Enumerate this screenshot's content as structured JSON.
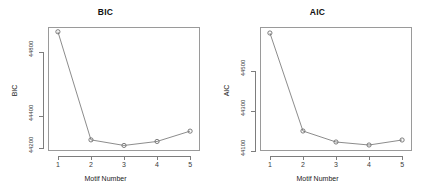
{
  "figure": {
    "background_color": "#ffffff",
    "line_color": "#6e6e6e",
    "axis_color": "#7d7d7d"
  },
  "panels": [
    {
      "key": "bic",
      "title": "BIC",
      "xlabel": "Motif Number",
      "ylabel": "BIC",
      "x_tick_labels": [
        "1",
        "2",
        "3",
        "4",
        "5"
      ],
      "y_tick_labels": [
        "44800",
        "44400",
        "44200"
      ]
    },
    {
      "key": "aic",
      "title": "AIC",
      "xlabel": "Motif Number",
      "ylabel": "AIC",
      "x_tick_labels": [
        "1",
        "2",
        "3",
        "4",
        "5"
      ],
      "y_tick_labels": [
        "44500",
        "44300",
        "44100"
      ]
    }
  ],
  "chart_data": [
    {
      "type": "line",
      "title": "BIC",
      "xlabel": "Motif Number",
      "ylabel": "BIC",
      "x": [
        1,
        2,
        3,
        4,
        5
      ],
      "values": [
        44930,
        44250,
        44215,
        44240,
        44305
      ],
      "categories": [
        "1",
        "2",
        "3",
        "4",
        "5"
      ],
      "xlim": [
        0.7,
        5.3
      ],
      "ylim": [
        44180,
        44960
      ],
      "ytick_values": [
        44800,
        44400,
        44200
      ],
      "ytick_labels": [
        "44800",
        "44400",
        "44200"
      ],
      "xtick_values": [
        1,
        2,
        3,
        4,
        5
      ],
      "xtick_labels": [
        "1",
        "2",
        "3",
        "4",
        "5"
      ],
      "marker": "open-circle",
      "grid": false,
      "legend": false
    },
    {
      "type": "line",
      "title": "AIC",
      "xlabel": "Motif Number",
      "ylabel": "AIC",
      "x": [
        1,
        2,
        3,
        4,
        5
      ],
      "values": [
        44690,
        44200,
        44145,
        44130,
        44155
      ],
      "categories": [
        "1",
        "2",
        "3",
        "4",
        "5"
      ],
      "xlim": [
        0.7,
        5.3
      ],
      "ylim": [
        44100,
        44720
      ],
      "ytick_values": [
        44500,
        44300,
        44100
      ],
      "ytick_labels": [
        "44500",
        "44300",
        "44100"
      ],
      "xtick_values": [
        1,
        2,
        3,
        4,
        5
      ],
      "xtick_labels": [
        "1",
        "2",
        "3",
        "4",
        "5"
      ],
      "marker": "open-circle",
      "grid": false,
      "legend": false
    }
  ]
}
